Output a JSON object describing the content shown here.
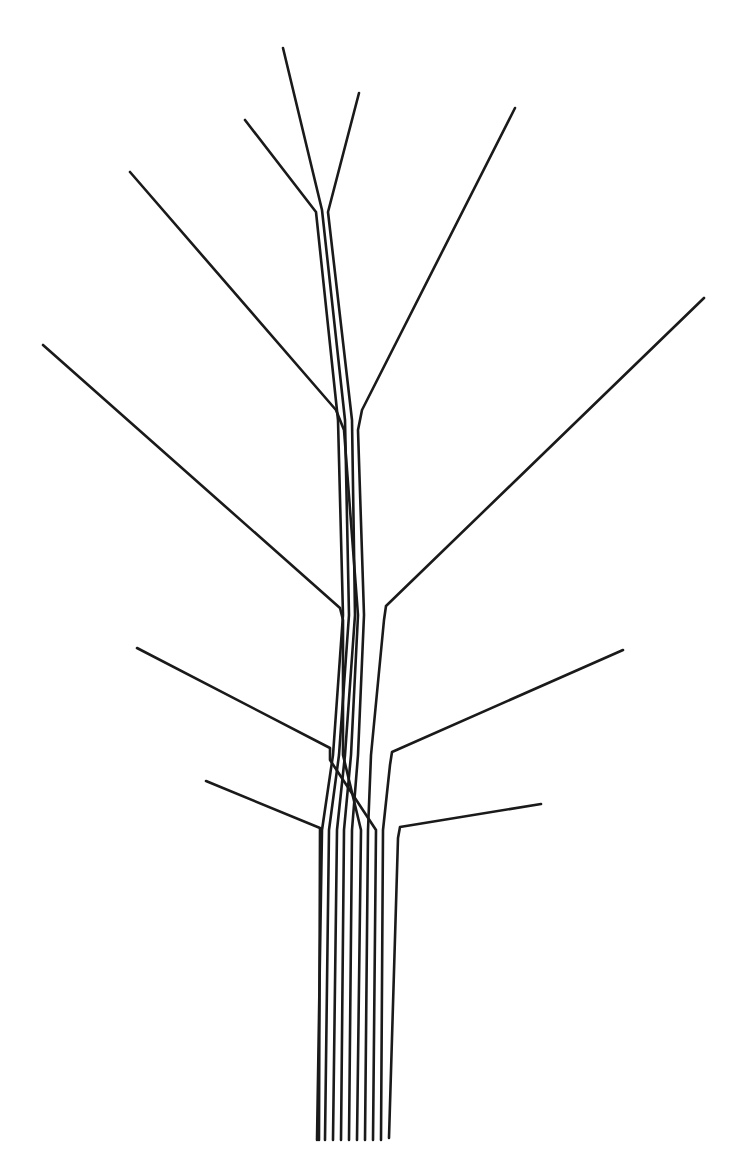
{
  "diagram": {
    "title": "",
    "stroke_color": "#1a1a1a",
    "background_color": "#ffffff",
    "stroke_width": 2.6,
    "strands": [
      {
        "name": "top-left-branch",
        "points": [
          [
            245,
            120
          ],
          [
            316,
            212
          ],
          [
            338,
            420
          ],
          [
            343,
            615
          ],
          [
            333,
            755
          ],
          [
            322,
            830
          ],
          [
            317,
            1140
          ]
        ]
      },
      {
        "name": "top-center-branch",
        "points": [
          [
            283,
            48
          ],
          [
            322,
            210
          ],
          [
            345,
            420
          ],
          [
            349,
            615
          ],
          [
            339,
            755
          ],
          [
            329,
            830
          ],
          [
            325,
            1140
          ]
        ]
      },
      {
        "name": "top-right-branch",
        "points": [
          [
            359,
            93
          ],
          [
            328,
            212
          ],
          [
            352,
            420
          ],
          [
            355,
            615
          ],
          [
            345,
            755
          ],
          [
            337,
            830
          ],
          [
            333,
            1140
          ]
        ]
      },
      {
        "name": "upper-left-branch",
        "points": [
          [
            130,
            172
          ],
          [
            336,
            410
          ],
          [
            344,
            430
          ],
          [
            358,
            615
          ],
          [
            351,
            755
          ],
          [
            344,
            830
          ],
          [
            341,
            1140
          ]
        ]
      },
      {
        "name": "upper-right-branch",
        "points": [
          [
            515,
            108
          ],
          [
            362,
            410
          ],
          [
            358,
            430
          ],
          [
            364,
            615
          ],
          [
            358,
            755
          ],
          [
            352,
            830
          ],
          [
            349,
            1140
          ]
        ]
      },
      {
        "name": "middle-left-branch",
        "points": [
          [
            43,
            345
          ],
          [
            340,
            608
          ],
          [
            343,
            620
          ],
          [
            343,
            755
          ],
          [
            361,
            830
          ],
          [
            357,
            1140
          ]
        ]
      },
      {
        "name": "middle-right-branch",
        "points": [
          [
            704,
            298
          ],
          [
            386,
            606
          ],
          [
            384,
            620
          ],
          [
            371,
            755
          ],
          [
            368,
            830
          ],
          [
            365,
            1140
          ]
        ]
      },
      {
        "name": "lower-left-branch",
        "points": [
          [
            137,
            648
          ],
          [
            330,
            748
          ],
          [
            330,
            760
          ],
          [
            376,
            830
          ],
          [
            373,
            1140
          ]
        ]
      },
      {
        "name": "lower-right-branch",
        "points": [
          [
            623,
            650
          ],
          [
            392,
            752
          ],
          [
            390,
            765
          ],
          [
            383,
            830
          ],
          [
            381,
            1140
          ]
        ]
      },
      {
        "name": "bottom-left-branch",
        "points": [
          [
            206,
            781
          ],
          [
            320,
            828
          ],
          [
            319,
            1140
          ]
        ]
      },
      {
        "name": "bottom-right-branch",
        "points": [
          [
            541,
            804
          ],
          [
            400,
            827
          ],
          [
            398,
            838
          ],
          [
            389,
            1138
          ]
        ]
      }
    ]
  }
}
